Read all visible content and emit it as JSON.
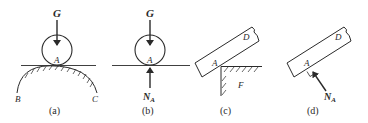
{
  "panels": [
    {
      "id": "a",
      "caption": "(a)",
      "labels": {
        "force": "G",
        "contact": "A",
        "left_end": "B",
        "right_end": "C"
      }
    },
    {
      "id": "b",
      "caption": "(b)",
      "labels": {
        "force": "G",
        "contact": "A",
        "normal": "N",
        "normal_sub": "A"
      }
    },
    {
      "id": "c",
      "caption": "(c)",
      "labels": {
        "body": "D",
        "contact": "A",
        "support": "F"
      }
    },
    {
      "id": "d",
      "caption": "(d)",
      "labels": {
        "body": "D",
        "contact": "A",
        "normal": "N",
        "normal_sub": "A"
      }
    }
  ],
  "colors": {
    "stroke": "#2a2a2a",
    "background": "#ffffff"
  }
}
